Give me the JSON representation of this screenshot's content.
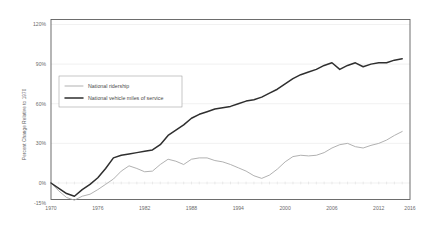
{
  "chart_data": {
    "type": "line",
    "title": "",
    "subtitle": "",
    "xlabel": "",
    "ylabel": "Percent Change Relative to 1970",
    "xlim": [
      1970,
      2016
    ],
    "ylim": [
      -15,
      120
    ],
    "grid": "horizontal",
    "legend_position": "upper-left-inside",
    "ytick_labels": [
      "120%",
      "90%",
      "60%",
      "30%",
      "0%",
      "-15%"
    ],
    "ytick_values": [
      120,
      90,
      60,
      30,
      0,
      -15
    ],
    "xtick_labels": [
      "1970",
      "1976",
      "1982",
      "1988",
      "1994",
      "2000",
      "2006",
      "2012",
      "2016"
    ],
    "xtick_values": [
      1970,
      1976,
      1982,
      1988,
      1994,
      2000,
      2006,
      2012,
      2016
    ],
    "x": [
      1970,
      1971,
      1972,
      1973,
      1974,
      1975,
      1976,
      1977,
      1978,
      1979,
      1980,
      1981,
      1982,
      1983,
      1984,
      1985,
      1986,
      1987,
      1988,
      1989,
      1990,
      1991,
      1992,
      1993,
      1994,
      1995,
      1996,
      1997,
      1998,
      1999,
      2000,
      2001,
      2002,
      2003,
      2004,
      2005,
      2006,
      2007,
      2008,
      2009,
      2010,
      2011,
      2012,
      2013,
      2014,
      2015
    ],
    "series": [
      {
        "name": "National ridership",
        "color": "#a8a8a8",
        "width": 0.9,
        "values": [
          0,
          -6,
          -11,
          -13,
          -10,
          -8.5,
          -5,
          -1,
          3,
          9,
          13,
          11,
          8.5,
          9,
          14,
          18,
          16.5,
          14,
          18,
          19,
          19,
          17,
          16,
          14,
          11.5,
          9,
          5.5,
          3.5,
          6,
          10.5,
          16,
          20,
          21,
          20.5,
          21,
          23,
          26.5,
          29,
          30,
          27.5,
          26.5,
          28.5,
          30,
          32.5,
          36,
          39
        ]
      },
      {
        "name": "National vehicle miles of service",
        "color": "#2f2f2f",
        "width": 1.5,
        "values": [
          0,
          -4,
          -8,
          -10,
          -5,
          -1,
          4,
          11,
          19,
          21,
          22,
          23,
          24,
          25,
          29,
          36,
          40,
          44,
          49,
          52,
          54,
          56,
          57,
          58,
          60,
          62,
          63,
          65,
          68,
          71,
          75,
          79,
          82,
          84,
          86,
          89,
          91,
          86,
          89,
          91,
          88,
          90,
          91,
          91,
          93,
          94
        ]
      }
    ]
  },
  "axis": {
    "y_title": "Percent Change Relative to 1970"
  },
  "legend": {
    "items": [
      {
        "label": "National ridership"
      },
      {
        "label": "National vehicle miles of service"
      }
    ]
  }
}
